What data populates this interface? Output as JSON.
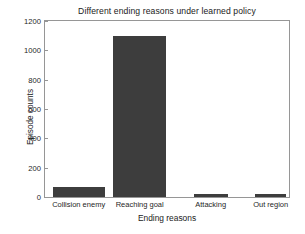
{
  "chart_data": {
    "type": "bar",
    "title": "Different ending reasons under learned policy",
    "xlabel": "Ending reasons",
    "ylabel": "Episode counts",
    "categories": [
      "Collision enemy",
      "Reaching goal",
      "Attacking",
      "Out region"
    ],
    "values": [
      68,
      1100,
      20,
      18
    ],
    "ylim": [
      0,
      1200
    ],
    "yticks": [
      0,
      200,
      400,
      600,
      800,
      1000,
      1200
    ],
    "ytick_labels": [
      "0",
      "200",
      "400",
      "600",
      "800",
      "1000",
      "1200"
    ],
    "grid": false,
    "legend": null,
    "bar_color": "#3d3d3d",
    "axis_color": "#969696",
    "background_color": "#ffffff",
    "bar_geometry": [
      {
        "left_pct": 3.3,
        "width_pct": 21.1
      },
      {
        "left_pct": 28.0,
        "width_pct": 21.5
      },
      {
        "left_pct": 61.0,
        "width_pct": 13.8
      },
      {
        "left_pct": 86.2,
        "width_pct": 12.6
      }
    ],
    "tick_center_pct": [
      13.8,
      38.8,
      67.9,
      92.5
    ]
  }
}
